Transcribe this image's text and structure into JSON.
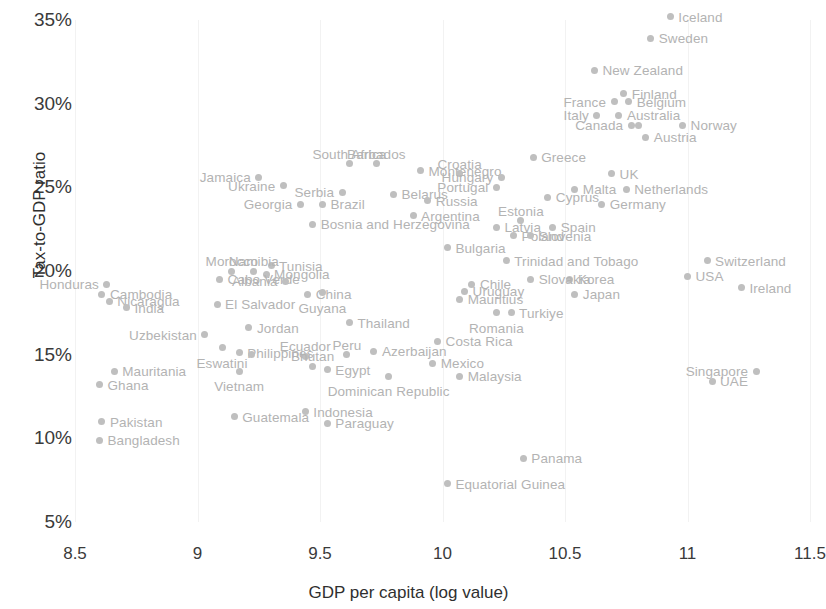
{
  "chart_data": {
    "type": "scatter",
    "title": "",
    "xlabel": "GDP per capita (log value)",
    "ylabel": "Tax-to-GDP ratio",
    "xlim": [
      8.5,
      11.5
    ],
    "ylim": [
      5,
      35
    ],
    "xticks": [
      "8.5",
      "9",
      "9.5",
      "10",
      "10.5",
      "11",
      "11.5"
    ],
    "xtick_values": [
      8.5,
      9,
      9.5,
      10,
      10.5,
      11,
      11.5
    ],
    "yticks": [
      "5%",
      "10%",
      "15%",
      "20%",
      "25%",
      "30%",
      "35%"
    ],
    "ytick_values": [
      5,
      10,
      15,
      20,
      25,
      30,
      35
    ],
    "grid": "vertical-only",
    "legend": "none",
    "point_color": "#bfbfbf",
    "label_color": "#b3b3b3",
    "points": [
      {
        "name": "Iceland",
        "x": 10.93,
        "y": 35.2,
        "pos": "right"
      },
      {
        "name": "Sweden",
        "x": 10.85,
        "y": 33.9,
        "pos": "right"
      },
      {
        "name": "New Zealand",
        "x": 10.62,
        "y": 32.0,
        "pos": "right"
      },
      {
        "name": "Finland",
        "x": 10.74,
        "y": 30.6,
        "pos": "right"
      },
      {
        "name": "Belgium",
        "x": 10.76,
        "y": 30.1,
        "pos": "right"
      },
      {
        "name": "France",
        "x": 10.7,
        "y": 30.1,
        "pos": "left"
      },
      {
        "name": "Italy",
        "x": 10.63,
        "y": 29.3,
        "pos": "left"
      },
      {
        "name": "Australia",
        "x": 10.72,
        "y": 29.3,
        "pos": "right"
      },
      {
        "name": "Canada",
        "x": 10.77,
        "y": 28.7,
        "pos": "left"
      },
      {
        "name": "Canada2",
        "x": 10.8,
        "y": 28.7,
        "pos": "none"
      },
      {
        "name": "Norway",
        "x": 10.98,
        "y": 28.7,
        "pos": "right"
      },
      {
        "name": "Austria",
        "x": 10.83,
        "y": 28.0,
        "pos": "right"
      },
      {
        "name": "Greece",
        "x": 10.37,
        "y": 26.8,
        "pos": "right"
      },
      {
        "name": "South Africa",
        "x": 9.62,
        "y": 26.4,
        "pos": "above"
      },
      {
        "name": "Barbados",
        "x": 9.73,
        "y": 26.4,
        "pos": "above"
      },
      {
        "name": "Montenegro",
        "x": 9.91,
        "y": 26.0,
        "pos": "right"
      },
      {
        "name": "Croatia",
        "x": 10.07,
        "y": 25.8,
        "pos": "above"
      },
      {
        "name": "UK",
        "x": 10.69,
        "y": 25.8,
        "pos": "right"
      },
      {
        "name": "Hungary",
        "x": 10.24,
        "y": 25.6,
        "pos": "left"
      },
      {
        "name": "Jamaica",
        "x": 9.25,
        "y": 25.6,
        "pos": "left"
      },
      {
        "name": "Ukraine",
        "x": 9.35,
        "y": 25.1,
        "pos": "left"
      },
      {
        "name": "Portugal",
        "x": 10.22,
        "y": 25.0,
        "pos": "left"
      },
      {
        "name": "Malta",
        "x": 10.54,
        "y": 24.9,
        "pos": "right"
      },
      {
        "name": "Netherlands",
        "x": 10.75,
        "y": 24.9,
        "pos": "right"
      },
      {
        "name": "Serbia",
        "x": 9.59,
        "y": 24.7,
        "pos": "left"
      },
      {
        "name": "Belarus",
        "x": 9.8,
        "y": 24.6,
        "pos": "right"
      },
      {
        "name": "Cyprus",
        "x": 10.43,
        "y": 24.4,
        "pos": "right"
      },
      {
        "name": "Russia",
        "x": 9.94,
        "y": 24.2,
        "pos": "right"
      },
      {
        "name": "Georgia",
        "x": 9.42,
        "y": 24.0,
        "pos": "left"
      },
      {
        "name": "Brazil",
        "x": 9.51,
        "y": 24.0,
        "pos": "right"
      },
      {
        "name": "Germany",
        "x": 10.65,
        "y": 24.0,
        "pos": "right"
      },
      {
        "name": "Argentina",
        "x": 9.88,
        "y": 23.3,
        "pos": "right"
      },
      {
        "name": "Estonia",
        "x": 10.32,
        "y": 23.0,
        "pos": "above"
      },
      {
        "name": "Bosnia and Herzegovina",
        "x": 9.47,
        "y": 22.8,
        "pos": "right"
      },
      {
        "name": "Latvia",
        "x": 10.22,
        "y": 22.6,
        "pos": "right"
      },
      {
        "name": "Spain",
        "x": 10.45,
        "y": 22.6,
        "pos": "right"
      },
      {
        "name": "Poland",
        "x": 10.29,
        "y": 22.1,
        "pos": "right"
      },
      {
        "name": "Slovenia",
        "x": 10.36,
        "y": 22.1,
        "pos": "right"
      },
      {
        "name": "Bulgaria",
        "x": 10.02,
        "y": 21.4,
        "pos": "right"
      },
      {
        "name": "Switzerland",
        "x": 11.08,
        "y": 20.6,
        "pos": "right"
      },
      {
        "name": "Trinidad and Tobago",
        "x": 10.26,
        "y": 20.6,
        "pos": "right"
      },
      {
        "name": "Tunisia",
        "x": 9.3,
        "y": 20.3,
        "pos": "right"
      },
      {
        "name": "Namibia",
        "x": 9.23,
        "y": 20.0,
        "pos": "above"
      },
      {
        "name": "Morocco",
        "x": 9.14,
        "y": 20.0,
        "pos": "above"
      },
      {
        "name": "Mongolia",
        "x": 9.28,
        "y": 19.8,
        "pos": "right"
      },
      {
        "name": "USA",
        "x": 11.0,
        "y": 19.7,
        "pos": "right"
      },
      {
        "name": "Korea",
        "x": 10.52,
        "y": 19.5,
        "pos": "right"
      },
      {
        "name": "Slovakia",
        "x": 10.36,
        "y": 19.5,
        "pos": "right"
      },
      {
        "name": "Cabo Verde",
        "x": 9.09,
        "y": 19.5,
        "pos": "right"
      },
      {
        "name": "Albania",
        "x": 9.36,
        "y": 19.4,
        "pos": "left"
      },
      {
        "name": "Chile",
        "x": 10.12,
        "y": 19.2,
        "pos": "right"
      },
      {
        "name": "Ireland",
        "x": 11.22,
        "y": 19.0,
        "pos": "right"
      },
      {
        "name": "Honduras",
        "x": 8.63,
        "y": 19.2,
        "pos": "left"
      },
      {
        "name": "Uruguay",
        "x": 10.09,
        "y": 18.8,
        "pos": "right"
      },
      {
        "name": "Japan",
        "x": 10.54,
        "y": 18.6,
        "pos": "right"
      },
      {
        "name": "China",
        "x": 9.45,
        "y": 18.6,
        "pos": "right"
      },
      {
        "name": "Cambodia",
        "x": 8.61,
        "y": 18.6,
        "pos": "right"
      },
      {
        "name": "Guyana",
        "x": 9.51,
        "y": 18.7,
        "pos": "below"
      },
      {
        "name": "Mauritius",
        "x": 10.07,
        "y": 18.3,
        "pos": "right"
      },
      {
        "name": "Nicaragua",
        "x": 8.64,
        "y": 18.2,
        "pos": "right"
      },
      {
        "name": "El Salvador",
        "x": 9.08,
        "y": 18.0,
        "pos": "right"
      },
      {
        "name": "India",
        "x": 8.71,
        "y": 17.8,
        "pos": "right"
      },
      {
        "name": "Turkiye",
        "x": 10.28,
        "y": 17.5,
        "pos": "right"
      },
      {
        "name": "Romania",
        "x": 10.22,
        "y": 17.5,
        "pos": "below"
      },
      {
        "name": "Thailand",
        "x": 9.62,
        "y": 16.9,
        "pos": "right"
      },
      {
        "name": "Jordan",
        "x": 9.21,
        "y": 16.6,
        "pos": "right"
      },
      {
        "name": "Uzbekistan",
        "x": 9.03,
        "y": 16.2,
        "pos": "left"
      },
      {
        "name": "Costa Rica",
        "x": 9.98,
        "y": 15.8,
        "pos": "right"
      },
      {
        "name": "Eswatini",
        "x": 9.1,
        "y": 15.4,
        "pos": "below"
      },
      {
        "name": "Azerbaijan",
        "x": 9.72,
        "y": 15.2,
        "pos": "right"
      },
      {
        "name": "Peru",
        "x": 9.61,
        "y": 15.0,
        "pos": "above"
      },
      {
        "name": "Philippines",
        "x": 9.17,
        "y": 15.1,
        "pos": "right"
      },
      {
        "name": "Philippines2",
        "x": 9.22,
        "y": 15.0,
        "pos": "none"
      },
      {
        "name": "Ecuador",
        "x": 9.44,
        "y": 14.9,
        "pos": "above"
      },
      {
        "name": "Mexico",
        "x": 9.96,
        "y": 14.5,
        "pos": "right"
      },
      {
        "name": "Singapore",
        "x": 11.28,
        "y": 14.0,
        "pos": "left"
      },
      {
        "name": "Egypt",
        "x": 9.53,
        "y": 14.1,
        "pos": "right"
      },
      {
        "name": "Bhutan",
        "x": 9.47,
        "y": 14.3,
        "pos": "above"
      },
      {
        "name": "Vietnam",
        "x": 9.17,
        "y": 14.0,
        "pos": "below"
      },
      {
        "name": "Mauritania",
        "x": 8.66,
        "y": 14.0,
        "pos": "right"
      },
      {
        "name": "Malaysia",
        "x": 10.07,
        "y": 13.7,
        "pos": "right"
      },
      {
        "name": "Dominican Republic",
        "x": 9.78,
        "y": 13.7,
        "pos": "below"
      },
      {
        "name": "UAE",
        "x": 11.1,
        "y": 13.4,
        "pos": "right"
      },
      {
        "name": "Ghana",
        "x": 8.6,
        "y": 13.2,
        "pos": "right"
      },
      {
        "name": "Indonesia",
        "x": 9.44,
        "y": 11.6,
        "pos": "right"
      },
      {
        "name": "Guatemala",
        "x": 9.15,
        "y": 11.3,
        "pos": "right"
      },
      {
        "name": "Pakistan",
        "x": 8.61,
        "y": 11.0,
        "pos": "right"
      },
      {
        "name": "Paraguay",
        "x": 9.53,
        "y": 10.9,
        "pos": "right"
      },
      {
        "name": "Bangladesh",
        "x": 8.6,
        "y": 9.9,
        "pos": "right"
      },
      {
        "name": "Panama",
        "x": 10.33,
        "y": 8.8,
        "pos": "right"
      },
      {
        "name": "Equatorial Guinea",
        "x": 10.02,
        "y": 7.3,
        "pos": "right"
      }
    ]
  }
}
